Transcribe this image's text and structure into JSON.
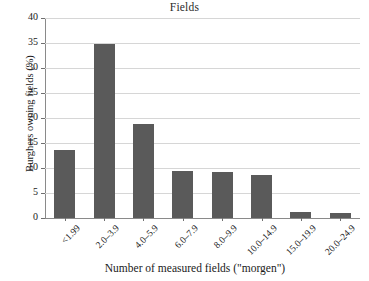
{
  "chart_data": {
    "type": "bar",
    "title": "Fields",
    "xlabel": "Number of measured fields (\"morgen\")",
    "ylabel": "Burghers owning fields (%)",
    "categories": [
      "<1.99",
      "2.0–3.9",
      "4.0–5.9",
      "6.0–7.9",
      "8.0–9.9",
      "10.0–14.9",
      "15.0–19.9",
      "20.0–24.9"
    ],
    "values": [
      13.6,
      34.9,
      18.8,
      9.4,
      9.2,
      8.7,
      1.2,
      1.1
    ],
    "ylim": [
      0,
      40
    ],
    "yticks": [
      0,
      5,
      10,
      15,
      20,
      25,
      30,
      35,
      40
    ],
    "ytick_labels": [
      "0",
      "5",
      "10",
      "15",
      "20",
      "25",
      "30",
      "35",
      "40"
    ],
    "grid": "horizontal",
    "legend": "none",
    "bar_color": "#5a5a5a",
    "gridline_color": "#d6d6d6",
    "axis_color": "#8a8a8a"
  }
}
